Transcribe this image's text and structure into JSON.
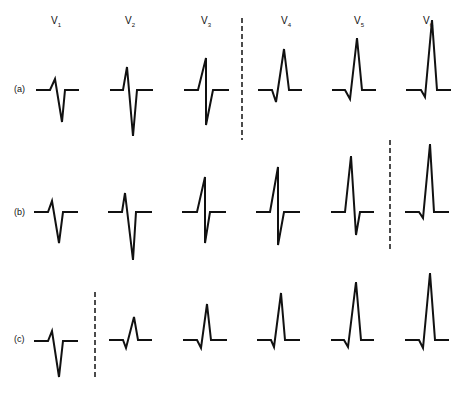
{
  "figure": {
    "leads": [
      {
        "label": "V",
        "sub": "1",
        "x": 56
      },
      {
        "label": "V",
        "sub": "2",
        "x": 130
      },
      {
        "label": "V",
        "sub": "3",
        "x": 206
      },
      {
        "label": "V",
        "sub": "4",
        "x": 286
      },
      {
        "label": "V",
        "sub": "5",
        "x": 359
      },
      {
        "label": "V",
        "sub": "6",
        "x": 428
      }
    ],
    "rows": [
      {
        "label": "(a)",
        "y": 90,
        "transition_after_lead": 3
      },
      {
        "label": "(b)",
        "y": 212,
        "transition_after_lead": 5
      },
      {
        "label": "(c)",
        "y": 340,
        "transition_after_lead": 1
      }
    ],
    "stroke_color": "#111111",
    "background": "#ffffff"
  }
}
